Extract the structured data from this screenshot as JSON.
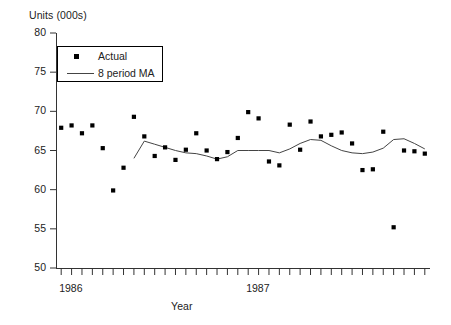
{
  "chart_data": {
    "type": "scatter",
    "title": "",
    "ylabel": "Units (000s)",
    "xlabel": "Year",
    "ylim": [
      50,
      80
    ],
    "yticks": [
      50,
      55,
      60,
      65,
      70,
      75,
      80
    ],
    "ytick_labels": [
      "50",
      "55",
      "60",
      "65",
      "70",
      "75",
      "80"
    ],
    "xtick_labels": [
      "1986",
      "1987"
    ],
    "xtick_label_positions": [
      1,
      19
    ],
    "x_minor_tick_count": 36,
    "grid": false,
    "legend_position": "upper-left-inside",
    "series": [
      {
        "name": "Actual",
        "marker": "square",
        "color": "#000000",
        "x": [
          1,
          2,
          3,
          4,
          5,
          6,
          7,
          8,
          9,
          10,
          11,
          12,
          13,
          14,
          15,
          16,
          17,
          18,
          19,
          20,
          21,
          22,
          23,
          24,
          25,
          26,
          27,
          28,
          29,
          30,
          31,
          32,
          33,
          34,
          35,
          36
        ],
        "values": [
          67.9,
          68.2,
          67.2,
          68.2,
          65.3,
          59.9,
          62.8,
          69.3,
          66.8,
          64.3,
          65.4,
          63.8,
          65.1,
          67.2,
          65.0,
          63.9,
          64.8,
          66.6,
          69.9,
          69.1,
          63.6,
          63.1,
          68.3,
          65.1,
          68.7,
          66.8,
          67.0,
          67.3,
          65.9,
          62.5,
          62.6,
          67.4,
          55.2,
          65.0,
          64.9,
          64.6
        ]
      },
      {
        "name": "8 period MA",
        "marker": "line",
        "color": "#444444",
        "x": [
          8,
          9,
          10,
          11,
          12,
          13,
          14,
          15,
          16,
          17,
          18,
          19,
          20,
          21,
          22,
          23,
          24,
          25,
          26,
          27,
          28,
          29,
          30,
          31,
          32,
          33,
          34,
          35,
          36
        ],
        "values": [
          64.0,
          66.2,
          65.8,
          65.4,
          65.0,
          64.7,
          64.6,
          64.3,
          63.9,
          64.2,
          65.0,
          65.0,
          65.0,
          65.0,
          64.7,
          65.2,
          65.9,
          66.4,
          66.3,
          65.6,
          65.0,
          64.7,
          64.6,
          64.8,
          65.3,
          66.4,
          66.5,
          65.9,
          65.2
        ]
      }
    ]
  },
  "legend": {
    "entries": [
      {
        "label": "Actual",
        "symbol": "square-marker"
      },
      {
        "label": "8 period MA",
        "symbol": "line-segment"
      }
    ]
  }
}
